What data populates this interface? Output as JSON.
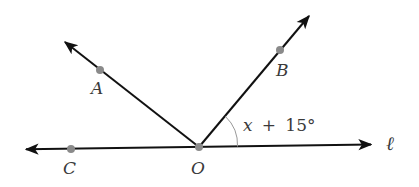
{
  "diagram": {
    "type": "geometry-angles",
    "line_label": "ℓ",
    "vertex": {
      "label": "O",
      "x": 199,
      "y": 147
    },
    "points": [
      {
        "label": "C",
        "x": 71,
        "y": 149
      },
      {
        "label": "A",
        "x": 100,
        "y": 70
      },
      {
        "label": "B",
        "x": 280,
        "y": 50
      }
    ],
    "angle_label": {
      "var": "x",
      "op": "+",
      "value": "15°"
    },
    "colors": {
      "line": "#111111",
      "point": "#8a8a8a",
      "arc": "#999999",
      "text": "#3a3a3a"
    }
  }
}
